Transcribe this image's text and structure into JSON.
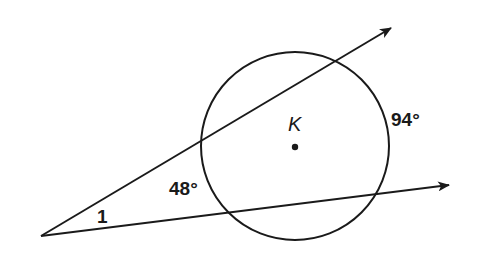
{
  "diagram": {
    "type": "geometry-secants-circle",
    "circle": {
      "center_label": "K",
      "cx": 295,
      "cy": 146,
      "r": 94
    },
    "vertex": {
      "x": 41,
      "y": 236
    },
    "rays": [
      {
        "name": "upper-secant",
        "x2": 393,
        "y2": 27
      },
      {
        "name": "lower-secant",
        "x2": 451,
        "y2": 185
      }
    ],
    "labels": {
      "angle": "1",
      "near_arc": "48°",
      "far_arc": "94°",
      "center": "K"
    },
    "colors": {
      "stroke": "#1a1a1a",
      "background": "#ffffff"
    }
  }
}
